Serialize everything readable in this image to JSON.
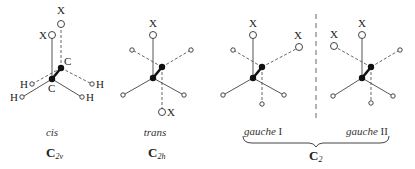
{
  "figure": {
    "conformers": [
      {
        "id": "cis",
        "name": "cis",
        "point_group": {
          "main": "C",
          "sub": "2v"
        },
        "labels": {
          "front_top": "X",
          "back_top": "X",
          "back_carbon": "C",
          "front_carbon": "C",
          "back_left": "H",
          "front_left": "H",
          "back_right": "H",
          "front_right": "H"
        }
      },
      {
        "id": "trans",
        "name": "trans",
        "point_group": {
          "main": "C",
          "sub": "2h"
        },
        "labels": {
          "front_top": "X",
          "back_bottom": "X"
        }
      },
      {
        "id": "gauche-1",
        "name": "gauche",
        "numeral": "I",
        "labels": {
          "front_top": "X",
          "back_upper_right": "X"
        }
      },
      {
        "id": "gauche-2",
        "name": "gauche",
        "numeral": "II",
        "labels": {
          "front_top": "X",
          "back_upper_left": "X"
        }
      }
    ],
    "gauche_group": {
      "point_group": {
        "main": "C",
        "sub": "2"
      }
    }
  }
}
